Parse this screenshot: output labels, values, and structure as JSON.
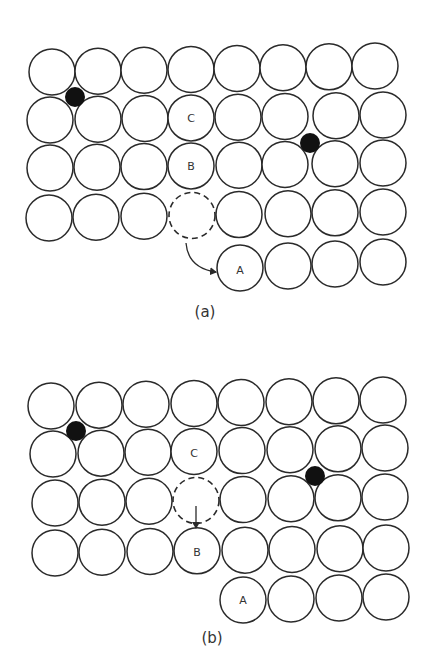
{
  "figure": {
    "radius": 23,
    "colors": {
      "atom_stroke": "#2a2a2a",
      "interstitial": "#111111",
      "background": "#ffffff"
    },
    "panels": [
      {
        "id": "a",
        "caption": "(a)",
        "caption_pos": [
          205,
          312
        ],
        "rows": [
          {
            "y_start": 72,
            "y_end": 66,
            "x": [
              52,
              98,
              144,
              191,
              237,
              283,
              329,
              375
            ]
          },
          {
            "y_start": 120,
            "y_end": 115,
            "x": [
              50,
              98,
              145,
              191,
              238,
              285,
              336,
              383
            ]
          },
          {
            "y_start": 168,
            "y_end": 163,
            "x": [
              50,
              97,
              144,
              191,
              239,
              285,
              335,
              383
            ]
          },
          {
            "y_start": 218,
            "y_end": 212,
            "x": [
              49,
              96,
              144,
              192,
              239,
              288,
              335,
              383
            ]
          },
          {
            "y_start": 268,
            "y_end": 262,
            "x": [
              240,
              288,
              335,
              383
            ],
            "first_index": 4
          }
        ],
        "vacancy": {
          "row": 3,
          "col": 3
        },
        "labels": [
          {
            "text": "C",
            "x": 191,
            "y": 118
          },
          {
            "text": "B",
            "x": 191,
            "y": 166
          },
          {
            "text": "A",
            "x": 240,
            "y": 270
          }
        ],
        "interstitials": [
          {
            "x": 75,
            "y": 97,
            "r": 10
          },
          {
            "x": 310,
            "y": 143,
            "r": 10
          }
        ],
        "arrow": {
          "type": "curved",
          "from": [
            186,
            243
          ],
          "to": [
            216,
            272
          ],
          "label": "vacancy-to-A jump"
        }
      },
      {
        "id": "b",
        "caption": "(b)",
        "caption_pos": [
          212,
          638
        ],
        "rows": [
          {
            "y_start": 406,
            "y_end": 400,
            "x": [
              51,
              99,
              146,
              194,
              241,
              289,
              336,
              383
            ]
          },
          {
            "y_start": 454,
            "y_end": 448,
            "x": [
              53,
              101,
              148,
              194,
              242,
              290,
              338,
              385
            ]
          },
          {
            "y_start": 503,
            "y_end": 497,
            "x": [
              55,
              102,
              149,
              196,
              243,
              291,
              338,
              385
            ]
          },
          {
            "y_start": 553,
            "y_end": 548,
            "x": [
              55,
              102,
              150,
              197,
              245,
              292,
              340,
              386
            ]
          },
          {
            "y_start": 600,
            "y_end": 597,
            "x": [
              243,
              291,
              339,
              386
            ],
            "first_index": 4
          }
        ],
        "vacancy": {
          "row": 2,
          "col": 3
        },
        "labels": [
          {
            "text": "C",
            "x": 194,
            "y": 453
          },
          {
            "text": "B",
            "x": 197,
            "y": 552
          },
          {
            "text": "A",
            "x": 243,
            "y": 600
          }
        ],
        "interstitials": [
          {
            "x": 76,
            "y": 431,
            "r": 10
          },
          {
            "x": 315,
            "y": 476,
            "r": 10
          }
        ],
        "arrow": {
          "type": "straight",
          "from": [
            196,
            506
          ],
          "to": [
            196,
            528
          ],
          "label": "B-to-vacancy jump"
        }
      }
    ]
  }
}
